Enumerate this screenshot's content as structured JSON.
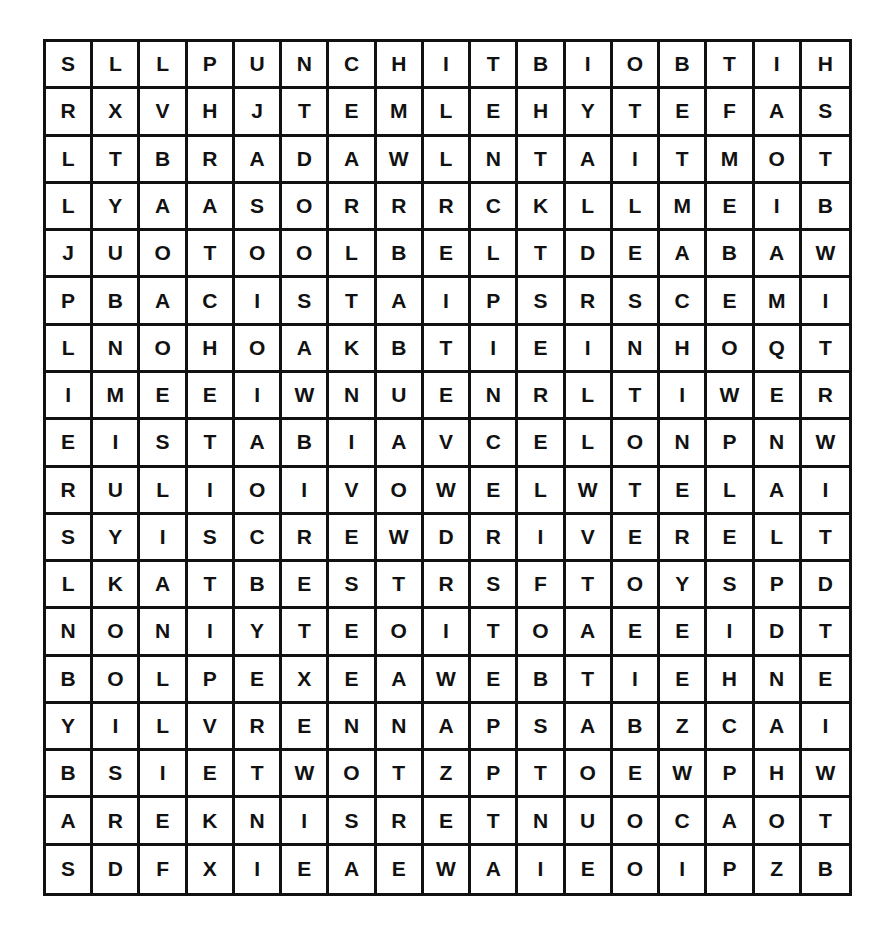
{
  "puzzle": {
    "rows": 18,
    "cols": 17,
    "grid": [
      [
        "S",
        "L",
        "L",
        "P",
        "U",
        "N",
        "C",
        "H",
        "I",
        "T",
        "B",
        "I",
        "O",
        "B",
        "T",
        "I",
        "H"
      ],
      [
        "R",
        "X",
        "V",
        "H",
        "J",
        "T",
        "E",
        "M",
        "L",
        "E",
        "H",
        "Y",
        "T",
        "E",
        "F",
        "A",
        "S"
      ],
      [
        "L",
        "T",
        "B",
        "R",
        "A",
        "D",
        "A",
        "W",
        "L",
        "N",
        "T",
        "A",
        "I",
        "T",
        "M",
        "O",
        "T"
      ],
      [
        "L",
        "Y",
        "A",
        "A",
        "S",
        "O",
        "R",
        "R",
        "R",
        "C",
        "K",
        "L",
        "L",
        "M",
        "E",
        "I",
        "B"
      ],
      [
        "J",
        "U",
        "O",
        "T",
        "O",
        "O",
        "L",
        "B",
        "E",
        "L",
        "T",
        "D",
        "E",
        "A",
        "B",
        "A",
        "W"
      ],
      [
        "P",
        "B",
        "A",
        "C",
        "I",
        "S",
        "T",
        "A",
        "I",
        "P",
        "S",
        "R",
        "S",
        "C",
        "E",
        "M",
        "I"
      ],
      [
        "L",
        "N",
        "O",
        "H",
        "O",
        "A",
        "K",
        "B",
        "T",
        "I",
        "E",
        "I",
        "N",
        "H",
        "O",
        "Q",
        "T"
      ],
      [
        "I",
        "M",
        "E",
        "E",
        "I",
        "W",
        "N",
        "U",
        "E",
        "N",
        "R",
        "L",
        "T",
        "I",
        "W",
        "E",
        "R"
      ],
      [
        "E",
        "I",
        "S",
        "T",
        "A",
        "B",
        "I",
        "A",
        "V",
        "C",
        "E",
        "L",
        "O",
        "N",
        "P",
        "N",
        "W"
      ],
      [
        "R",
        "U",
        "L",
        "I",
        "O",
        "I",
        "V",
        "O",
        "W",
        "E",
        "L",
        "W",
        "T",
        "E",
        "L",
        "A",
        "I"
      ],
      [
        "S",
        "Y",
        "I",
        "S",
        "C",
        "R",
        "E",
        "W",
        "D",
        "R",
        "I",
        "V",
        "E",
        "R",
        "E",
        "L",
        "T"
      ],
      [
        "L",
        "K",
        "A",
        "T",
        "B",
        "E",
        "S",
        "T",
        "R",
        "S",
        "F",
        "T",
        "O",
        "Y",
        "S",
        "P",
        "D"
      ],
      [
        "N",
        "O",
        "N",
        "I",
        "Y",
        "T",
        "E",
        "O",
        "I",
        "T",
        "O",
        "A",
        "E",
        "E",
        "I",
        "D",
        "T"
      ],
      [
        "B",
        "O",
        "L",
        "P",
        "E",
        "X",
        "E",
        "A",
        "W",
        "E",
        "B",
        "T",
        "I",
        "E",
        "H",
        "N",
        "E"
      ],
      [
        "Y",
        "I",
        "L",
        "V",
        "R",
        "E",
        "N",
        "N",
        "A",
        "P",
        "S",
        "A",
        "B",
        "Z",
        "C",
        "A",
        "I"
      ],
      [
        "B",
        "S",
        "I",
        "E",
        "T",
        "W",
        "O",
        "T",
        "Z",
        "P",
        "T",
        "O",
        "E",
        "W",
        "P",
        "H",
        "W"
      ],
      [
        "A",
        "R",
        "E",
        "K",
        "N",
        "I",
        "S",
        "R",
        "E",
        "T",
        "N",
        "U",
        "O",
        "C",
        "A",
        "O",
        "T"
      ],
      [
        "S",
        "D",
        "F",
        "X",
        "I",
        "E",
        "A",
        "E",
        "W",
        "A",
        "I",
        "E",
        "O",
        "I",
        "P",
        "Z",
        "B"
      ]
    ]
  }
}
